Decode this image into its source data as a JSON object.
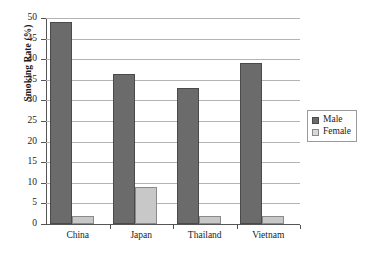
{
  "chart_data": {
    "type": "bar",
    "title": "",
    "subtitle": "",
    "xlabel": "",
    "ylabel": "Smoking Rate (%)",
    "categories": [
      "China",
      "Japan",
      "Thailand",
      "Vietnam"
    ],
    "series": [
      {
        "name": "Male",
        "color": "#6b6b6b",
        "values": [
          49,
          36.5,
          33,
          39
        ]
      },
      {
        "name": "Female",
        "color": "#c8c8c8",
        "values": [
          2,
          9,
          2,
          2
        ]
      }
    ],
    "ylim": [
      0,
      50
    ],
    "ytick_step": 5,
    "yticks": [
      0,
      5,
      10,
      15,
      20,
      25,
      30,
      35,
      40,
      45,
      50
    ],
    "ytick_labels": [
      "0",
      "5",
      "10",
      "15",
      "20",
      "25",
      "30",
      "35",
      "40",
      "45",
      "50"
    ],
    "grid": "horizontal",
    "legend_position": "right",
    "legend_entries": [
      "Male",
      "Female"
    ]
  },
  "legend": {
    "male_label": "Male",
    "female_label": "Female"
  },
  "axes": {
    "y_title": "Smoking Rate (%)"
  }
}
